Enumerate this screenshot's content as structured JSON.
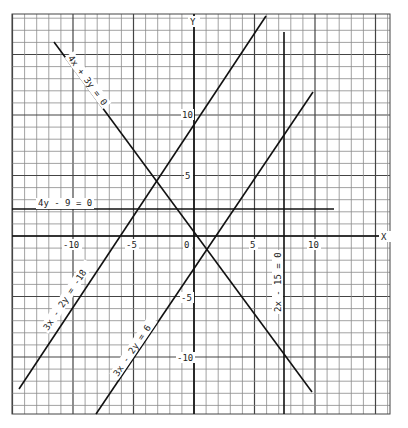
{
  "chart_data": {
    "type": "line",
    "title": "",
    "xlabel": "X",
    "ylabel": "Y",
    "xlim": [
      -15,
      16
    ],
    "ylim": [
      -14.5,
      18.3
    ],
    "grid": true,
    "x_ticks": [
      -10,
      -5,
      0,
      5,
      10
    ],
    "y_ticks": [
      10,
      5,
      -5,
      -10
    ],
    "series": [
      {
        "name": "4x + 3y = 0",
        "points": [
          [
            -11.5,
            15.33
          ],
          [
            9.7,
            -12.93
          ]
        ]
      },
      {
        "name": "3x - 2y = -18",
        "points": [
          [
            -14.4,
            -12.6
          ],
          [
            5.9,
            17.85
          ]
        ]
      },
      {
        "name": "3x - 2y = 6",
        "points": [
          [
            -8.0,
            -15.0
          ],
          [
            9.8,
            11.7
          ]
        ]
      },
      {
        "name": "4y - 9 = 0",
        "points": [
          [
            -15.0,
            2.25
          ],
          [
            11.6,
            2.25
          ]
        ]
      },
      {
        "name": "2x - 15 = 0",
        "points": [
          [
            7.5,
            16.8
          ],
          [
            7.5,
            -14.5
          ]
        ]
      }
    ]
  },
  "axes": {
    "x_label": "X",
    "y_label": "Y",
    "origin_label": "0",
    "x_tick_labels": [
      "-10",
      "-5",
      "5",
      "10"
    ],
    "y_tick_labels": [
      "10",
      "5",
      "-5",
      "-10"
    ]
  },
  "line_labels": {
    "l1": "4x + 3y = 0",
    "l2": "3x - 2y = -18",
    "l3": "3x - 2y = 6",
    "l4": "4y - 9 = 0",
    "l5": "2x - 15 = 0"
  }
}
